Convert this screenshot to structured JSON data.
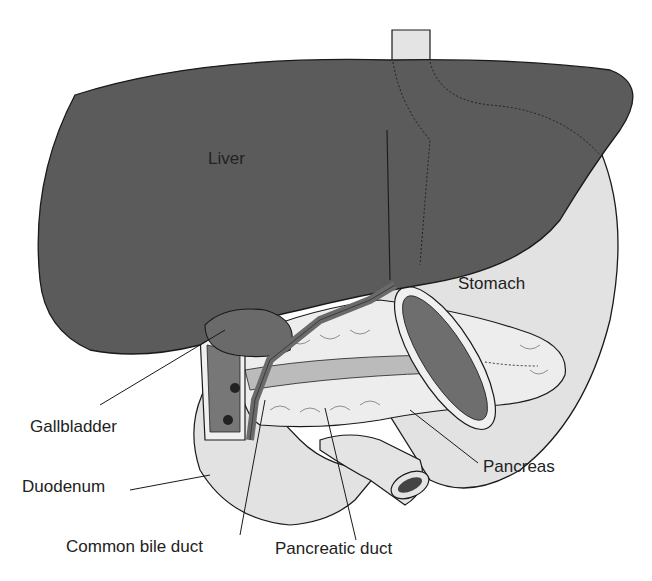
{
  "diagram": {
    "labels": {
      "liver": "Liver",
      "stomach": "Stomach",
      "gallbladder": "Gallbladder",
      "duodenum": "Duodenum",
      "pancreas": "Pancreas",
      "common_bile_duct": "Common bile duct",
      "pancreatic_duct": "Pancreatic duct"
    },
    "colors": {
      "liver": "#5b5b5b",
      "stomach": "#e2e2e2",
      "outline": "#1a1a1a",
      "background": "#ffffff"
    }
  }
}
